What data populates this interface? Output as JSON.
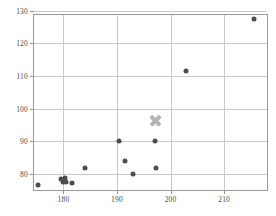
{
  "chart_data": {
    "type": "scatter",
    "title": "",
    "xlabel": "",
    "ylabel": "",
    "xlim": [
      174.5,
      218
    ],
    "ylim": [
      75.0,
      128.7
    ],
    "grid": true,
    "legend": "none",
    "xticks": [
      180,
      190,
      200,
      210
    ],
    "yticks": [
      80,
      90,
      100,
      110,
      120,
      130
    ],
    "xticklabels": [
      "180",
      "190",
      "200",
      "210"
    ],
    "yticklabels": [
      "80",
      "90",
      "100",
      "110",
      "120",
      "130"
    ],
    "series": [
      {
        "name": "data-points",
        "marker": "circle",
        "color": "#4d4d4d",
        "points": [
          {
            "x": 175.3,
            "y": 76.5
          },
          {
            "x": 179.6,
            "y": 78.3
          },
          {
            "x": 180.0,
            "y": 77.6
          },
          {
            "x": 180.3,
            "y": 78.6
          },
          {
            "x": 180.5,
            "y": 77.4
          },
          {
            "x": 181.6,
            "y": 77.0
          },
          {
            "x": 184.0,
            "y": 81.6
          },
          {
            "x": 190.4,
            "y": 90.0
          },
          {
            "x": 191.4,
            "y": 84.0
          },
          {
            "x": 192.9,
            "y": 80.0
          },
          {
            "x": 197.0,
            "y": 90.0
          },
          {
            "x": 197.2,
            "y": 81.6
          },
          {
            "x": 202.9,
            "y": 111.4
          },
          {
            "x": 215.5,
            "y": 127.4
          }
        ]
      },
      {
        "name": "highlight-marker",
        "marker": "x",
        "color": "#b4b4b4",
        "points": [
          {
            "x": 197.1,
            "y": 96.4
          }
        ]
      }
    ]
  },
  "axes": {
    "frame_color": "#9a9a9a",
    "grid_color": "#c9c9c9",
    "tick_color": "#8f8f8f",
    "label_color": "#4a4a4a"
  }
}
